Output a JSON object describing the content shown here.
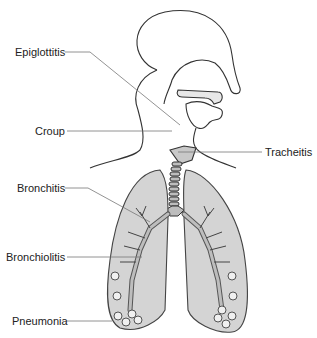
{
  "diagram": {
    "colors": {
      "outline": "#333333",
      "leader_line": "#666666",
      "lung_fill": "#d4d4d4",
      "airway_fill": "#bdbdbd",
      "background": "#ffffff"
    },
    "labels": [
      {
        "id": "epiglottitis",
        "text": "Epiglottitis"
      },
      {
        "id": "croup",
        "text": "Croup"
      },
      {
        "id": "tracheitis",
        "text": "Tracheitis"
      },
      {
        "id": "bronchitis",
        "text": "Bronchitis"
      },
      {
        "id": "bronchiolitis",
        "text": "Bronchiolitis"
      },
      {
        "id": "pneumonia",
        "text": "Pneumonia"
      }
    ]
  }
}
